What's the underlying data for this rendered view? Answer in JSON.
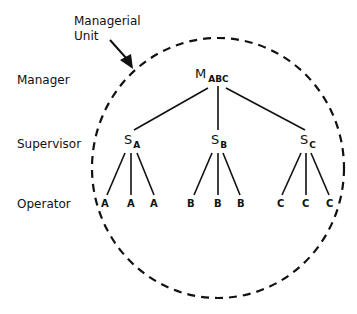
{
  "annotation": {
    "line1": "Managerial",
    "line2": "Unit"
  },
  "levels": {
    "manager": "Manager",
    "supervisor": "Supervisor",
    "operator": "Operator"
  },
  "manager": {
    "main": "M",
    "sub": "ABC"
  },
  "supervisors": [
    {
      "main": "S",
      "sub": "A"
    },
    {
      "main": "S",
      "sub": "B"
    },
    {
      "main": "S",
      "sub": "C"
    }
  ],
  "operators": {
    "A": [
      "A",
      "A",
      "A"
    ],
    "B": [
      "B",
      "B",
      "B"
    ],
    "C": [
      "C",
      "C",
      "C"
    ]
  }
}
